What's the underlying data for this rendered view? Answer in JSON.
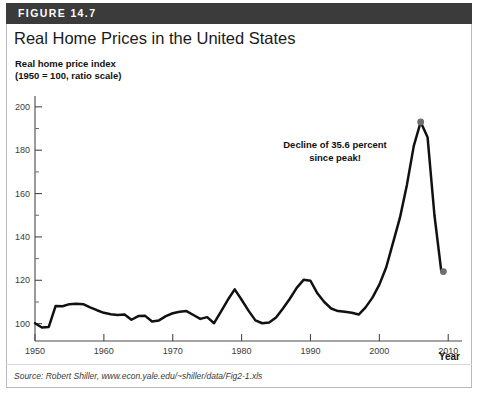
{
  "figure": {
    "number_label": "FIGURE 14.7",
    "title": "Real Home Prices in the United States",
    "source": "Source: Robert Shiller, www.econ.yale.edu/~shiller/data/Fig2-1.xls",
    "header_color": "#3b3b3b",
    "line_color": "#111111",
    "marker_color": "#6e6e6e"
  },
  "chart_data": {
    "type": "line",
    "title": "Real Home Prices in the United States",
    "subtitle": "",
    "ylabel": "Real home price index (1950 = 100, ratio scale)",
    "ylabel_line1": "Real home price index",
    "ylabel_line2": "(1950 = 100, ratio scale)",
    "xlabel": "Year",
    "xlim": [
      1950,
      2012
    ],
    "ylim": [
      92,
      205
    ],
    "yticks": [
      100,
      120,
      140,
      160,
      180,
      200
    ],
    "ytick_labels": [
      "100",
      "120",
      "140",
      "160",
      "180",
      "200"
    ],
    "xticks": [
      1950,
      1960,
      1970,
      1980,
      1990,
      2000,
      2010
    ],
    "xtick_labels": [
      "1950",
      "1960",
      "1970",
      "1980",
      "1990",
      "2000",
      "2010"
    ],
    "grid": false,
    "legend": false,
    "annotations": [
      {
        "text_line1": "Decline of 35.6 percent",
        "text_line2": "since peak!",
        "x": 1996.5,
        "y": 168
      }
    ],
    "markers": [
      {
        "label": "peak",
        "x": 2006,
        "y": 193
      },
      {
        "label": "latest",
        "x": 2009.3,
        "y": 124
      }
    ],
    "series": [
      {
        "name": "Real home price index",
        "x": [
          1950,
          1951,
          1952,
          1953,
          1954,
          1955,
          1956,
          1957,
          1958,
          1959,
          1960,
          1961,
          1962,
          1963,
          1964,
          1965,
          1966,
          1967,
          1968,
          1969,
          1970,
          1971,
          1972,
          1973,
          1974,
          1975,
          1976,
          1977,
          1978,
          1979,
          1980,
          1981,
          1982,
          1983,
          1984,
          1985,
          1986,
          1987,
          1988,
          1989,
          1990,
          1991,
          1992,
          1993,
          1994,
          1995,
          1996,
          1997,
          1998,
          1999,
          2000,
          2001,
          2002,
          2003,
          2004,
          2005,
          2006,
          2007,
          2008,
          2009
        ],
        "values": [
          100.2,
          98.2,
          98.5,
          108.2,
          108.0,
          109.0,
          109.2,
          109.0,
          107.5,
          106.2,
          105.0,
          104.3,
          104.0,
          104.2,
          101.8,
          103.5,
          103.6,
          101.0,
          101.5,
          103.5,
          104.8,
          105.5,
          105.8,
          104.0,
          102.2,
          103.0,
          100.2,
          105.5,
          111.0,
          115.8,
          111.0,
          106.0,
          101.5,
          100.2,
          100.5,
          102.8,
          107.0,
          111.5,
          116.5,
          120.2,
          119.8,
          114.0,
          110.0,
          107.0,
          105.8,
          105.5,
          105.0,
          104.2,
          107.5,
          112.0,
          118.0,
          126.0,
          137.5,
          149.0,
          164.0,
          182.0,
          193.0,
          186.0,
          150.0,
          124.0
        ]
      }
    ]
  }
}
